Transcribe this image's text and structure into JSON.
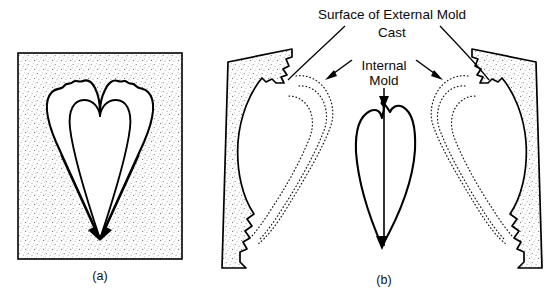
{
  "figure": {
    "background_color": "#ffffff",
    "ink_color": "#000000",
    "matrix_fill": "stipple-gray"
  },
  "labels": {
    "surface_external_mold": "Surface of External Mold",
    "cast": "Cast",
    "internal_mold_line1": "Internal",
    "internal_mold_line2": "Mold"
  },
  "captions": {
    "panel_a": "(a)",
    "panel_b": "(b)"
  },
  "panel_a": {
    "name": "intact-shell-in-matrix",
    "description": "Rectangular block of rock matrix containing a heart-shaped bivalve shell void with crenulated hinge margins at the top and two arrows converging at the lower apex.",
    "matrix_shape": "rectangle",
    "shell_shape": "heart",
    "arrow_count": 2
  },
  "panel_b": {
    "name": "split-mold-and-internal-mold",
    "description": "The rock split into two tilted blocks showing external mold surfaces, with dotted shell outlines, and a central heart-shaped internal mold with a vertical arrow.",
    "block_count": 2,
    "internal_mold_shape": "heart",
    "dotted_outline_count": 4,
    "arrow_count": 4
  }
}
